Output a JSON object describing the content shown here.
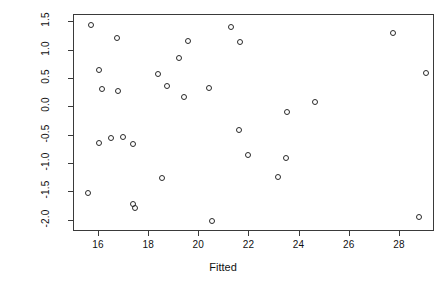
{
  "chart_data": {
    "type": "scatter",
    "title": "",
    "xlabel": "Fitted",
    "ylabel": "Standardized residuals",
    "xlim": [
      15.0,
      29.4
    ],
    "ylim": [
      -2.2,
      1.63
    ],
    "xticks": [
      16,
      18,
      20,
      22,
      24,
      26,
      28
    ],
    "xticklabels": [
      "16",
      "18",
      "20",
      "22",
      "24",
      "26",
      "28"
    ],
    "yticks": [
      1.5,
      1.0,
      0.5,
      0.0,
      -0.5,
      -1.0,
      -1.5,
      -2.0
    ],
    "yticklabels": [
      "1.5",
      "1.0",
      "0.5",
      "0.0",
      "-0.5",
      "-1.0",
      "-1.5",
      "-2.0"
    ],
    "grid": false,
    "legend": null,
    "marker": "open-circle",
    "marker_color": "#2a2a2a",
    "frame_color": "#3a3a3a",
    "background": "#ffffff",
    "n_points": 31,
    "points": [
      {
        "x": 15.67,
        "y": 1.46
      },
      {
        "x": 16.73,
        "y": 1.23
      },
      {
        "x": 16.0,
        "y": 0.66
      },
      {
        "x": 16.11,
        "y": 0.33
      },
      {
        "x": 16.75,
        "y": 0.28
      },
      {
        "x": 18.36,
        "y": 0.58
      },
      {
        "x": 18.71,
        "y": 0.37
      },
      {
        "x": 19.19,
        "y": 0.87
      },
      {
        "x": 19.4,
        "y": 0.19
      },
      {
        "x": 19.54,
        "y": 1.17
      },
      {
        "x": 20.38,
        "y": 0.35
      },
      {
        "x": 21.28,
        "y": 1.42
      },
      {
        "x": 21.62,
        "y": 1.15
      },
      {
        "x": 27.72,
        "y": 1.32
      },
      {
        "x": 29.04,
        "y": 0.61
      },
      {
        "x": 24.61,
        "y": 0.09
      },
      {
        "x": 23.49,
        "y": -0.09
      },
      {
        "x": 21.58,
        "y": -0.4
      },
      {
        "x": 16.0,
        "y": -0.63
      },
      {
        "x": 16.46,
        "y": -0.54
      },
      {
        "x": 16.95,
        "y": -0.52
      },
      {
        "x": 17.36,
        "y": -0.64
      },
      {
        "x": 21.96,
        "y": -0.84
      },
      {
        "x": 23.46,
        "y": -0.89
      },
      {
        "x": 23.15,
        "y": -1.23
      },
      {
        "x": 18.52,
        "y": -1.24
      },
      {
        "x": 15.57,
        "y": -1.52
      },
      {
        "x": 17.36,
        "y": -1.7
      },
      {
        "x": 17.44,
        "y": -1.77
      },
      {
        "x": 20.5,
        "y": -2.0
      },
      {
        "x": 28.77,
        "y": -1.93
      }
    ]
  },
  "axes": {
    "x_axis_label": "Fitted",
    "y_axis_label": "Standardized residuals"
  }
}
